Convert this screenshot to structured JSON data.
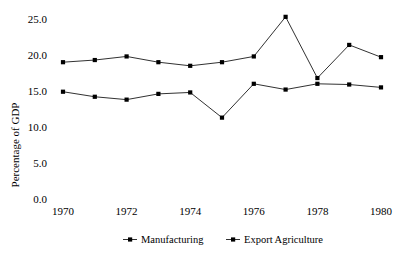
{
  "chart_data": {
    "type": "line",
    "title": "",
    "xlabel": "",
    "ylabel": "Percentage of GDP",
    "x": [
      1970,
      1971,
      1972,
      1973,
      1974,
      1975,
      1976,
      1977,
      1978,
      1979,
      1980
    ],
    "xtick_labels": [
      "1970",
      "1972",
      "1974",
      "1976",
      "1978",
      "1980"
    ],
    "xticks": [
      1970,
      1972,
      1974,
      1976,
      1978,
      1980
    ],
    "ytick_labels": [
      "0.0",
      "5.0",
      "10.0",
      "15.0",
      "20.0",
      "25.0"
    ],
    "yticks": [
      0.0,
      5.0,
      10.0,
      15.0,
      20.0,
      25.0
    ],
    "ylim": [
      0.0,
      26.0
    ],
    "xlim": [
      1969.4,
      1980.6
    ],
    "grid": false,
    "legend_position": "bottom",
    "marker": "square",
    "series": [
      {
        "name": "Manufacturing",
        "color": "#000000",
        "values": [
          19.0,
          19.3,
          19.8,
          19.0,
          18.5,
          19.0,
          19.8,
          25.3,
          16.8,
          21.4,
          19.7
        ]
      },
      {
        "name": "Export Agriculture",
        "color": "#000000",
        "values": [
          14.9,
          14.2,
          13.8,
          14.6,
          14.8,
          11.3,
          16.0,
          15.2,
          16.0,
          15.9,
          15.5
        ]
      }
    ]
  }
}
